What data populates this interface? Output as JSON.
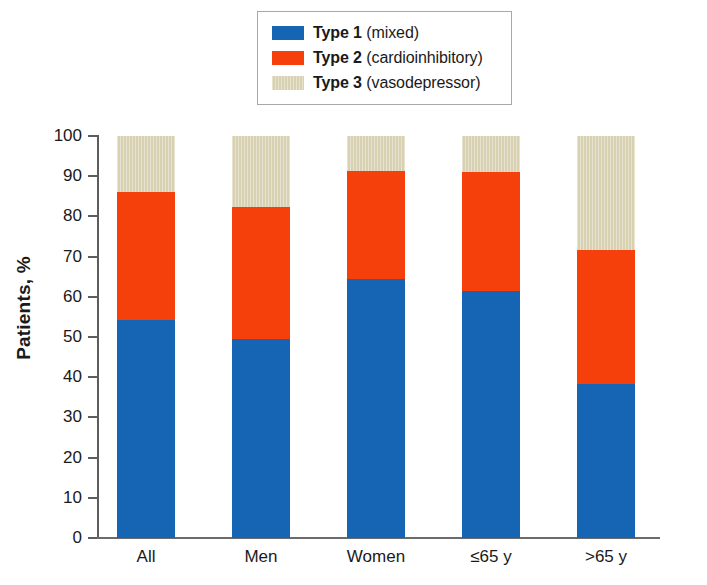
{
  "legend": {
    "position": "top-center",
    "items": [
      {
        "name": "Type 1",
        "detail": "(mixed)",
        "color": "#1664b4",
        "swatch": "solid-blue-swatch"
      },
      {
        "name": "Type 2",
        "detail": "(cardioinhibitory)",
        "color": "#f5400c",
        "swatch": "solid-orange-swatch"
      },
      {
        "name": "Type 3",
        "detail": "(vasodepressor)",
        "color": "#d7d1b2",
        "swatch": "striped-tan-swatch"
      }
    ]
  },
  "axes": {
    "ylabel": "Patients, %",
    "yticks": [
      "0",
      "10",
      "20",
      "30",
      "40",
      "50",
      "60",
      "70",
      "80",
      "90",
      "100"
    ],
    "xticks": [
      "All",
      "Men",
      "Women",
      "≤65 y",
      ">65 y"
    ]
  },
  "chart_data": {
    "type": "bar",
    "stacked": true,
    "title": "",
    "xlabel": "",
    "ylabel": "Patients, %",
    "ylim": [
      0,
      100
    ],
    "ytick_step": 10,
    "grid": false,
    "legend_position": "top-center",
    "categories": [
      "All",
      "Men",
      "Women",
      "≤65 y",
      ">65 y"
    ],
    "series": [
      {
        "name": "Type 1 (mixed)",
        "color": "#1664b4",
        "values": [
          54.2,
          49.4,
          64.5,
          61.5,
          38.2
        ]
      },
      {
        "name": "Type 2 (cardioinhibitory)",
        "color": "#f5400c",
        "values": [
          31.8,
          33.0,
          26.7,
          29.6,
          33.4
        ]
      },
      {
        "name": "Type 3 (vasodepressor)",
        "color": "#d7d1b2",
        "values": [
          14.0,
          17.6,
          8.8,
          8.9,
          28.4
        ]
      }
    ],
    "cumulative_tops": {
      "type1": [
        54.2,
        49.4,
        64.5,
        61.5,
        38.2
      ],
      "type1_plus_type2": [
        86.0,
        82.4,
        91.2,
        91.1,
        71.6
      ],
      "total": [
        100,
        100,
        100,
        100,
        100
      ]
    }
  }
}
